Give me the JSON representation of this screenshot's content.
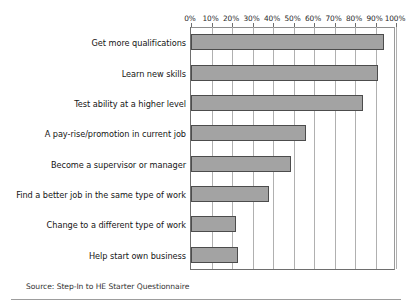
{
  "chart_data": {
    "type": "bar",
    "orientation": "horizontal",
    "title": "",
    "xlabel": "",
    "ylabel": "",
    "xlim": [
      0,
      100
    ],
    "xticks": [
      "0%",
      "10%",
      "20%",
      "30%",
      "40%",
      "50%",
      "60%",
      "70%",
      "80%",
      "90%",
      "100%"
    ],
    "xtick_values": [
      0,
      10,
      20,
      30,
      40,
      50,
      60,
      70,
      80,
      90,
      100
    ],
    "grid": true,
    "legend": "none",
    "categories": [
      "Get more qualifications",
      "Learn new skills",
      "Test ability at a higher level",
      "A pay-rise/promotion in current job",
      "Become a supervisor or manager",
      "Find a better job in the same type of work",
      "Change to a different type of work",
      "Help start own business"
    ],
    "values": [
      94,
      91,
      84,
      56,
      49,
      38,
      22,
      23
    ],
    "bar_color": "#a3a3a3",
    "bar_edge_color": "#4c4c4c"
  },
  "footer": {
    "source": "Source: Step-In to HE Starter Questionnaire"
  }
}
